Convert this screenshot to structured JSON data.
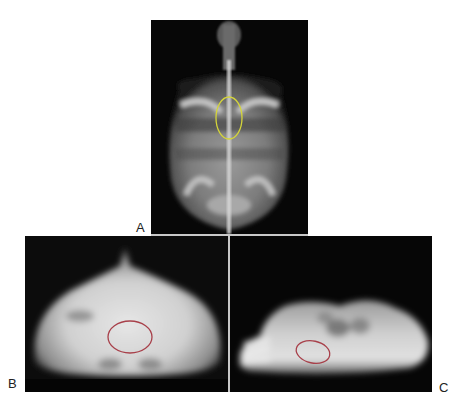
{
  "figure": {
    "panels": [
      {
        "id": "A",
        "label": "A",
        "view": "dorsoventral radiograph",
        "marker": {
          "shape": "ellipse",
          "color": "#d4d43a"
        }
      },
      {
        "id": "B",
        "label": "B",
        "view": "craniocaudal radiograph",
        "marker": {
          "shape": "ellipse",
          "color": "#a8404a"
        }
      },
      {
        "id": "C",
        "label": "C",
        "view": "lateral radiograph",
        "marker": {
          "shape": "ellipse",
          "color": "#a8404a"
        }
      }
    ]
  }
}
